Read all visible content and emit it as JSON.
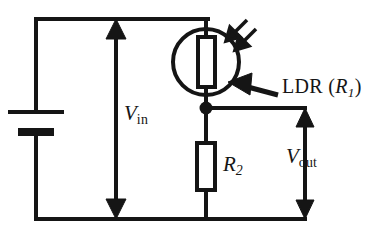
{
  "diagram": {
    "type": "circuit-schematic",
    "background_color": "#ffffff",
    "line_color": "#151515"
  },
  "labels": {
    "vin": {
      "symbol": "V",
      "subscript": "in",
      "full": "Vin"
    },
    "vout": {
      "symbol": "V",
      "subscript": "out",
      "full": "Vout"
    },
    "r2": {
      "symbol": "R",
      "subscript": "2",
      "full": "R2"
    },
    "ldr": {
      "text": "LDR",
      "open_paren": "(",
      "symbol": "R",
      "subscript": "1",
      "close_paren": ")",
      "full": "LDR (R1)"
    }
  },
  "components": {
    "battery": {
      "name": "battery",
      "terminals": 2
    },
    "ldr": {
      "name": "light-dependent-resistor",
      "symbol": "resistor-in-circle-with-light-arrows"
    },
    "r2": {
      "name": "fixed-resistor",
      "symbol": "rectangle-resistor"
    },
    "junction": {
      "name": "node-dot"
    }
  },
  "annotations": {
    "light_arrows": {
      "count": 2,
      "direction": "down-left",
      "meaning": "incident-light"
    },
    "pointer_arrow": {
      "direction": "left",
      "points_to": "ldr"
    }
  },
  "colors": {
    "stroke": "#151515",
    "fill": "#ffffff",
    "text": "#151515"
  }
}
